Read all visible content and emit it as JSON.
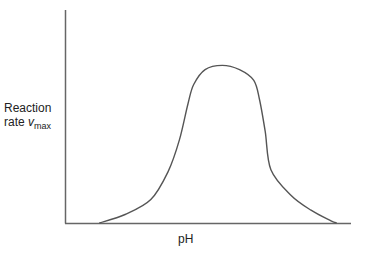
{
  "chart_data": {
    "type": "line",
    "title": "",
    "xlabel": "pH",
    "ylabel": "Reaction rate v_max",
    "ylabel_parts": {
      "line1": "Reaction",
      "line2_prefix": "rate ",
      "var": "v",
      "sub": "max"
    },
    "grid": false,
    "legend": null,
    "ticks": {
      "x": [],
      "y": []
    },
    "series": [
      {
        "name": "rate",
        "color": "#555555",
        "x": [
          0.12,
          0.21,
          0.3,
          0.36,
          0.4,
          0.43,
          0.45,
          0.49,
          0.55,
          0.61,
          0.66,
          0.68,
          0.7,
          0.72,
          0.79,
          0.86,
          0.93,
          0.95
        ],
        "y": [
          0.0,
          0.04,
          0.11,
          0.24,
          0.39,
          0.56,
          0.65,
          0.72,
          0.74,
          0.72,
          0.67,
          0.58,
          0.43,
          0.25,
          0.13,
          0.06,
          0.01,
          0.0
        ]
      }
    ],
    "xlim": [
      0,
      1
    ],
    "ylim": [
      0,
      1
    ]
  },
  "labels": {
    "x": "pH",
    "y_line1": "Reaction",
    "y_line2_prefix": "rate ",
    "y_var": "v",
    "y_sub": "max"
  }
}
